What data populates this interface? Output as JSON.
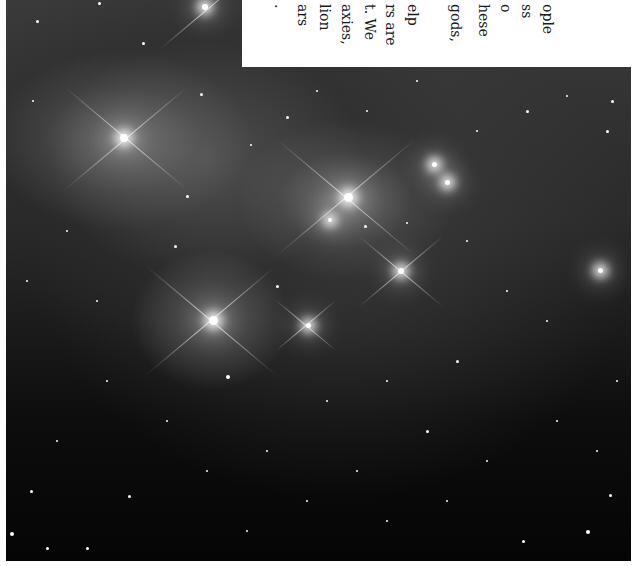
{
  "image": {
    "subject": "star cluster with reflection nebula",
    "description": "Dense starfield photograph with several bright stars showing diffraction spikes and surrounding wispy nebulosity"
  },
  "text_overlay": {
    "orientation": "rotated 90 degrees, read top-to-bottom",
    "lines": [
      {
        "text": "ople",
        "x": 548
      },
      {
        "text": "ss",
        "x": 527
      },
      {
        "text": "o",
        "x": 506
      },
      {
        "text": "hese",
        "x": 484
      },
      {
        "text": "gods,",
        "x": 456
      },
      {
        "text": "elp",
        "x": 413
      },
      {
        "text": "rs are",
        "x": 391
      },
      {
        "text": "t. We",
        "x": 370
      },
      {
        "text": "axies,",
        "x": 347
      },
      {
        "text": "lion",
        "x": 325
      },
      {
        "text": "ars",
        "x": 303
      },
      {
        "text": ".",
        "x": 280
      }
    ]
  }
}
